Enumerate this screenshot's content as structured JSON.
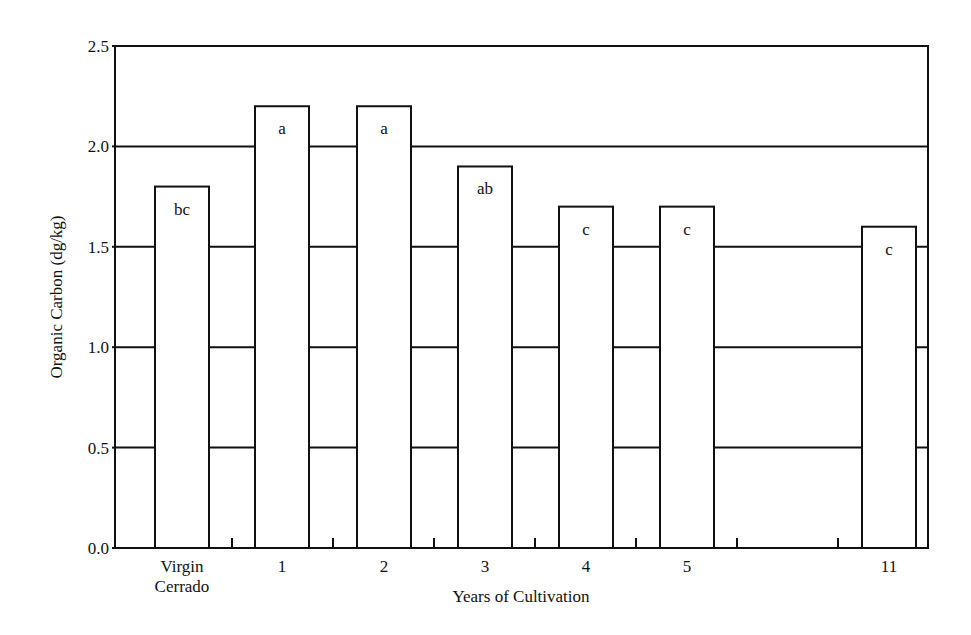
{
  "chart_data": {
    "type": "bar",
    "title": "",
    "xlabel": "Years of Cultivation",
    "ylabel": "Organic Carbon (dg/kg)",
    "ylim": [
      0,
      2.5
    ],
    "yticks": [
      "0.0",
      "0.5",
      "1.0",
      "1.5",
      "2.0",
      "2.5"
    ],
    "grid": "horizontal lines at each y tick (hidden behind bars)",
    "legend": null,
    "categories": [
      "Virgin Cerrado",
      "1",
      "2",
      "3",
      "4",
      "5",
      "11"
    ],
    "category_lines": [
      [
        "Virgin",
        "Cerrado"
      ],
      [
        "1"
      ],
      [
        "2"
      ],
      [
        "3"
      ],
      [
        "4"
      ],
      [
        "5"
      ],
      [
        "11"
      ]
    ],
    "values": [
      1.8,
      2.2,
      2.2,
      1.9,
      1.7,
      1.7,
      1.6
    ],
    "annotations": [
      "bc",
      "a",
      "a",
      "ab",
      "c",
      "c",
      "c"
    ]
  },
  "colors": {
    "bar_fill": "#ffffff",
    "stroke": "#111111",
    "background": "#ffffff"
  }
}
